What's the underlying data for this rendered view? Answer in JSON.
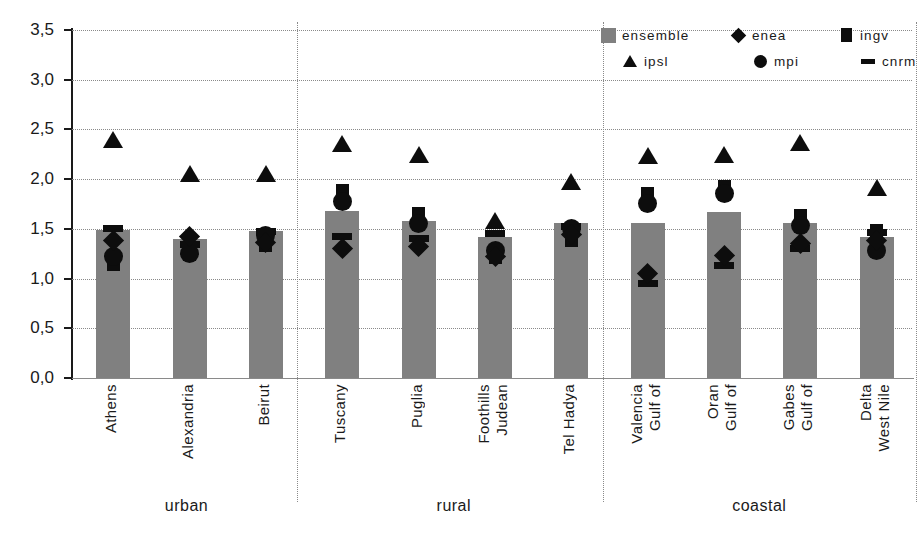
{
  "legend": {
    "position": "top-right",
    "entries": [
      {
        "name": "ensemble",
        "marker": "filled-square-gray",
        "color": "#808080"
      },
      {
        "name": "enea",
        "marker": "diamond-icon",
        "color": "#0d0d0d"
      },
      {
        "name": "ingv",
        "marker": "square-icon",
        "color": "#0d0d0d"
      },
      {
        "name": "ipsl",
        "marker": "triangle-icon",
        "color": "#0d0d0d"
      },
      {
        "name": "mpi",
        "marker": "circle-icon",
        "color": "#0d0d0d"
      },
      {
        "name": "cnrm",
        "marker": "dash-icon",
        "color": "#0d0d0d"
      }
    ]
  },
  "axis": {
    "y_ticks": [
      "0,0",
      "0,5",
      "1,0",
      "1,5",
      "2,0",
      "2,5",
      "3,0",
      "3,5"
    ],
    "y_tick_values": [
      0.0,
      0.5,
      1.0,
      1.5,
      2.0,
      2.5,
      3.0,
      3.5
    ]
  },
  "groups": [
    {
      "label": "urban",
      "count": 3
    },
    {
      "label": "rural",
      "count": 4
    },
    {
      "label": "coastal",
      "count": 4
    }
  ],
  "chart_data": {
    "type": "bar",
    "title": "",
    "xlabel": "",
    "ylabel": "",
    "ylim": [
      0.0,
      3.5
    ],
    "ytick_step": 0.5,
    "grid": "horizontal-dotted",
    "legend_position": "top-right",
    "categories": [
      "Athens",
      "Alexandria",
      "Beirut",
      "Tuscany",
      "Puglia",
      "Judean Foothills",
      "Tel Hadya",
      "Gulf of Valencia",
      "Gulf of Oran",
      "Gulf of Gabes",
      "West Nile Delta"
    ],
    "category_lines": [
      [
        "Athens"
      ],
      [
        "Alexandria"
      ],
      [
        "Beirut"
      ],
      [
        "Tuscany"
      ],
      [
        "Puglia"
      ],
      [
        "Judean",
        "Foothills"
      ],
      [
        "Tel Hadya"
      ],
      [
        "Gulf of",
        "Valencia"
      ],
      [
        "Gulf of",
        "Oran"
      ],
      [
        "Gulf of",
        "Gabes"
      ],
      [
        "West Nile",
        "Delta"
      ]
    ],
    "group_of_category": [
      "urban",
      "urban",
      "urban",
      "rural",
      "rural",
      "rural",
      "rural",
      "coastal",
      "coastal",
      "coastal",
      "coastal"
    ],
    "series": [
      {
        "name": "ensemble",
        "type": "bar",
        "values": [
          1.49,
          1.4,
          1.48,
          1.68,
          1.58,
          1.42,
          1.56,
          1.56,
          1.67,
          1.56,
          1.42
        ]
      },
      {
        "name": "enea",
        "type": "marker",
        "values": [
          1.38,
          1.42,
          1.36,
          1.3,
          1.32,
          1.22,
          1.44,
          1.05,
          1.23,
          1.35,
          1.38
        ]
      },
      {
        "name": "ingv",
        "type": "marker",
        "values": [
          1.15,
          1.25,
          1.34,
          1.88,
          1.64,
          1.22,
          1.39,
          1.85,
          1.92,
          1.62,
          1.47
        ]
      },
      {
        "name": "ipsl",
        "type": "marker",
        "values": [
          2.4,
          2.06,
          2.06,
          2.36,
          2.25,
          1.58,
          1.98,
          2.24,
          2.25,
          2.37,
          1.92
        ]
      },
      {
        "name": "mpi",
        "type": "marker",
        "values": [
          1.22,
          1.25,
          1.43,
          1.78,
          1.55,
          1.28,
          1.5,
          1.76,
          1.86,
          1.53,
          1.28
        ]
      },
      {
        "name": "cnrm",
        "type": "marker",
        "values": [
          1.5,
          1.34,
          1.47,
          1.42,
          1.4,
          1.45,
          1.52,
          0.95,
          1.13,
          1.3,
          1.46
        ]
      }
    ]
  }
}
